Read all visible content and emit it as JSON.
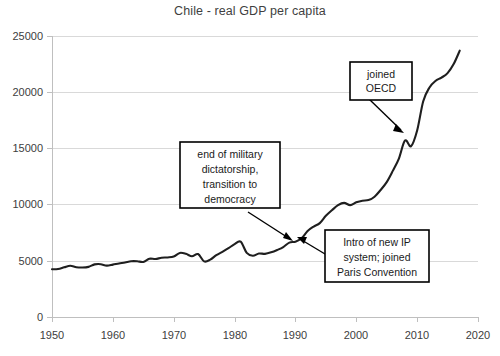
{
  "chart_data": {
    "type": "line",
    "title": "Chile - real GDP per capita",
    "xlabel": "",
    "ylabel": "",
    "xlim": [
      1950,
      2020
    ],
    "ylim": [
      0,
      25000
    ],
    "grid": true,
    "legend": "none",
    "xticks": [
      "1950",
      "1960",
      "1970",
      "1980",
      "1990",
      "2000",
      "2010",
      "2020"
    ],
    "xtick_values": [
      1950,
      1960,
      1970,
      1980,
      1990,
      2000,
      2010,
      2020
    ],
    "yticks": [
      "0",
      "5000",
      "10000",
      "15000",
      "20000",
      "25000"
    ],
    "ytick_values": [
      0,
      5000,
      10000,
      15000,
      20000,
      25000
    ],
    "series": [
      {
        "name": "real GDP per capita",
        "color": "#1f1f1f",
        "x": [
          1950,
          1951,
          1952,
          1953,
          1954,
          1955,
          1956,
          1957,
          1958,
          1959,
          1960,
          1961,
          1962,
          1963,
          1964,
          1965,
          1966,
          1967,
          1968,
          1969,
          1970,
          1971,
          1972,
          1973,
          1974,
          1975,
          1976,
          1977,
          1978,
          1979,
          1980,
          1981,
          1982,
          1983,
          1984,
          1985,
          1986,
          1987,
          1988,
          1989,
          1990,
          1991,
          1992,
          1993,
          1994,
          1995,
          1996,
          1997,
          1998,
          1999,
          2000,
          2001,
          2002,
          2003,
          2004,
          2005,
          2006,
          2007,
          2008,
          2009,
          2010,
          2011,
          2012,
          2013,
          2014,
          2015,
          2016,
          2017
        ],
        "y": [
          4250,
          4270,
          4420,
          4560,
          4430,
          4400,
          4460,
          4680,
          4700,
          4570,
          4660,
          4760,
          4850,
          4960,
          4960,
          4900,
          5180,
          5160,
          5270,
          5300,
          5380,
          5700,
          5620,
          5400,
          5600,
          4950,
          5100,
          5500,
          5800,
          6120,
          6480,
          6700,
          5700,
          5450,
          5650,
          5620,
          5750,
          5960,
          6220,
          6620,
          6700,
          7000,
          7650,
          8050,
          8350,
          9000,
          9500,
          9950,
          10150,
          9950,
          10200,
          10350,
          10400,
          10700,
          11300,
          12000,
          13000,
          14100,
          15700,
          15200,
          16600,
          19200,
          20400,
          21000,
          21300,
          21700,
          22500,
          23700
        ]
      }
    ],
    "annotations": [
      {
        "id": "end-of-dictatorship",
        "lines": [
          "end of military",
          "dictatorship,",
          "transition to",
          "democracy"
        ],
        "target_x": 1990,
        "target_y": 6700
      },
      {
        "id": "intro-ip-system",
        "lines": [
          "Intro of new IP",
          "system; joined",
          "Paris Convention"
        ],
        "target_x": 1991,
        "target_y": 7000
      },
      {
        "id": "joined-oecd",
        "lines": [
          "joined",
          "OECD"
        ],
        "target_x": 2007,
        "target_y": 16000
      }
    ]
  }
}
